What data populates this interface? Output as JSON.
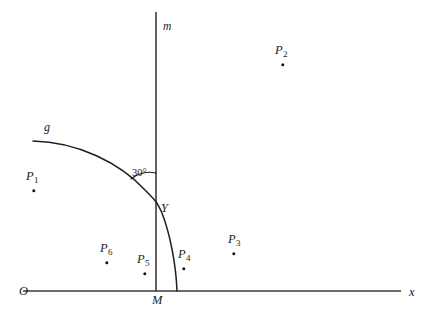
{
  "figure": {
    "type": "geometry-diagram",
    "background_color": "#ffffff",
    "stroke_color": "#3a3a3a",
    "text_color": "#1a1a1a",
    "width": 432,
    "height": 320
  },
  "axes": {
    "x_axis": {
      "label": "x",
      "label_x": 409,
      "label_y": 286,
      "origin_label": "O",
      "origin_label_x": 19,
      "origin_label_y": 285,
      "y": 291,
      "x_start": 23,
      "x_end": 401
    },
    "vertical_line": {
      "label": "m",
      "label_x": 163,
      "label_y": 21,
      "x": 156,
      "y_top": 12,
      "y_bottom": 291
    }
  },
  "curve": {
    "label": "g",
    "label_x": 44,
    "label_y": 121,
    "start": {
      "x": 33,
      "y": 141
    },
    "end": {
      "x": 177,
      "y": 291
    },
    "crossing_point": {
      "x": 156,
      "y": 203
    }
  },
  "angle": {
    "label": "30°",
    "label_x": 132,
    "label_y": 168,
    "value_degrees": 30,
    "vertex": {
      "x": 156,
      "y": 203
    }
  },
  "vertex_point": {
    "label": "Y",
    "label_x": 161,
    "label_y": 202,
    "x": 156,
    "y": 203
  },
  "points": [
    {
      "name": "P",
      "sub": "1",
      "label_x": 26,
      "label_y": 170,
      "dot_x": 34,
      "dot_y": 191
    },
    {
      "name": "P",
      "sub": "2",
      "label_x": 275,
      "label_y": 44,
      "dot_x": 283,
      "dot_y": 65
    },
    {
      "name": "P",
      "sub": "3",
      "label_x": 228,
      "label_y": 233,
      "dot_x": 234,
      "dot_y": 254
    },
    {
      "name": "P",
      "sub": "4",
      "label_x": 178,
      "label_y": 248,
      "dot_x": 184,
      "dot_y": 269
    },
    {
      "name": "P",
      "sub": "5",
      "label_x": 137,
      "label_y": 253,
      "dot_x": 145,
      "dot_y": 274
    },
    {
      "name": "P",
      "sub": "6",
      "label_x": 100,
      "label_y": 242,
      "dot_x": 107,
      "dot_y": 263
    }
  ]
}
